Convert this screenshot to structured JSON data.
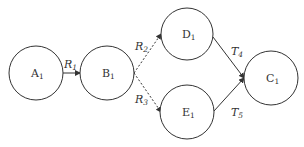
{
  "diagram": {
    "nodes": [
      {
        "id": "A",
        "label": "A",
        "sub": "1",
        "cx": 36,
        "cy": 73,
        "r": 27
      },
      {
        "id": "B",
        "label": "B",
        "sub": "1",
        "cx": 107,
        "cy": 73,
        "r": 27
      },
      {
        "id": "D",
        "label": "D",
        "sub": "1",
        "cx": 187,
        "cy": 34,
        "r": 26
      },
      {
        "id": "E",
        "label": "E",
        "sub": "1",
        "cx": 187,
        "cy": 112,
        "r": 27
      },
      {
        "id": "C",
        "label": "C",
        "sub": "1",
        "cx": 271,
        "cy": 78,
        "r": 27
      }
    ],
    "edges": [
      {
        "from": "A",
        "to": "B",
        "label": "R",
        "sub": "1",
        "style": "solid"
      },
      {
        "from": "B",
        "to": "D",
        "label": "R",
        "sub": "2",
        "style": "dotted"
      },
      {
        "from": "B",
        "to": "E",
        "label": "R",
        "sub": "3",
        "style": "dotted"
      },
      {
        "from": "D",
        "to": "C",
        "label": "T",
        "sub": "4",
        "style": "solid"
      },
      {
        "from": "E",
        "to": "C",
        "label": "T",
        "sub": "5",
        "style": "solid"
      }
    ]
  }
}
